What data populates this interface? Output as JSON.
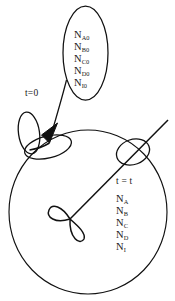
{
  "figure": {
    "stroke_color": "#111111",
    "background_color": "#ffffff"
  },
  "initial_state": {
    "time_label": "t=0",
    "species": [
      {
        "symbol": "N",
        "subscript": "A0"
      },
      {
        "symbol": "N",
        "subscript": "B0"
      },
      {
        "symbol": "N",
        "subscript": "C0"
      },
      {
        "symbol": "N",
        "subscript": "D0"
      },
      {
        "symbol": "N",
        "subscript": "I0"
      }
    ]
  },
  "final_state": {
    "time_label": "t = t",
    "species": [
      {
        "symbol": "N",
        "subscript": "A"
      },
      {
        "symbol": "N",
        "subscript": "B"
      },
      {
        "symbol": "N",
        "subscript": "C"
      },
      {
        "symbol": "N",
        "subscript": "D"
      },
      {
        "symbol": "N",
        "subscript": "I"
      }
    ]
  },
  "shapes": {
    "main_circle": "system-boundary-circle",
    "callout_ellipse": "initial-composition-callout",
    "inlet_ellipse": "inlet-element-ellipse",
    "inlet_ellipse_secondary": "inlet-element-ellipse-outer",
    "outlet_ellipse": "outlet-element-ellipse",
    "center_bowtie": "center-bowtie-element",
    "pointer_arrow": "callout-arrow",
    "diagonal_line": "sweep-radius-line"
  }
}
